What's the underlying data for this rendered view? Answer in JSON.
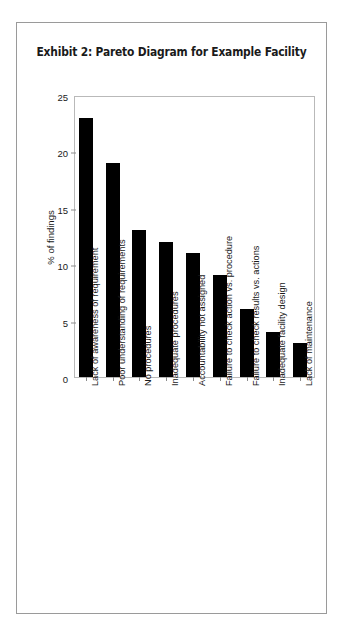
{
  "figure": {
    "title": "Exhibit 2: Pareto Diagram for Example Facility",
    "frame_color": "#9a9a9a",
    "plot_border_color": "#b9b9b9",
    "bar_color": "#000000",
    "text_color": "#1a1a1a",
    "background": "#ffffff"
  },
  "chart_data": {
    "type": "bar",
    "title": "Exhibit 2: Pareto Diagram for Example Facility",
    "xlabel": "",
    "ylabel": "% of findings",
    "ylim": [
      0,
      25
    ],
    "yticks": [
      0,
      5,
      10,
      15,
      20,
      25
    ],
    "grid": false,
    "legend": null,
    "orientation": "vertical",
    "categories": [
      "Lack of awareness of requirement",
      "Poor understanding of requirements",
      "No procedures",
      "Inadequate procedures",
      "Accountability not assigned",
      "Failure to check action vs. procedure",
      "Failure to check results vs. actions",
      "Inadequate facility design",
      "Lack of maintenance"
    ],
    "values": [
      23,
      19,
      13,
      12,
      11,
      9,
      6,
      4,
      3
    ]
  }
}
